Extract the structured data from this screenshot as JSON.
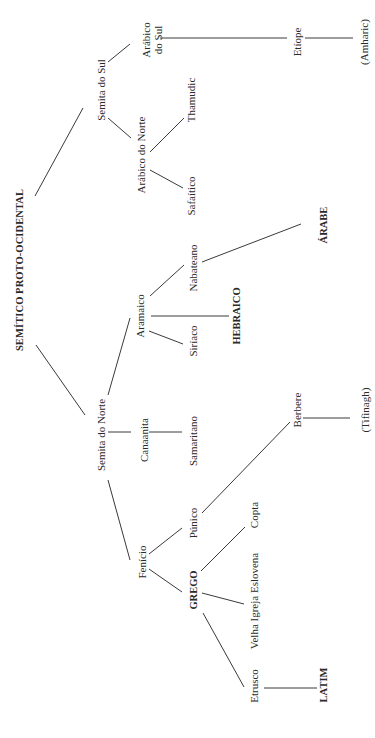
{
  "diagram": {
    "title": "SEMÍTICO PROTO-OCIDENTAL",
    "orientation": "rotated -90deg, root on left edge, tree grows to the right",
    "nodes": {
      "root": {
        "label": "SEMÍTICO PROTO-OCIDENTAL",
        "x": 20,
        "y": 270
      },
      "semita_sul": {
        "label": "Semita do Sul",
        "x": 101,
        "y": 90
      },
      "semita_norte": {
        "label": "Semita do Norte",
        "x": 101,
        "y": 435
      },
      "arabico_sul": {
        "label_line1": "Arábico",
        "label_line2": "do Sul",
        "x": 152,
        "y": 40
      },
      "arabico_norte": {
        "label": "Arábico do Norte",
        "x": 141,
        "y": 155
      },
      "thamudic": {
        "label": "Thamudic",
        "x": 191,
        "y": 100
      },
      "safaitico": {
        "label": "Safaítico",
        "x": 191,
        "y": 196
      },
      "etiope": {
        "label": "Etíope",
        "x": 297,
        "y": 42
      },
      "amharic": {
        "label": "(Amharic)",
        "x": 364,
        "y": 42
      },
      "aramaico": {
        "label": "Aramaico",
        "x": 140,
        "y": 316
      },
      "nabateano": {
        "label": "Nabateano",
        "x": 193,
        "y": 268
      },
      "siriaco": {
        "label": "Siríaco",
        "x": 193,
        "y": 341
      },
      "hebraico": {
        "label": "HEBRAICO",
        "x": 237,
        "y": 316
      },
      "arabe": {
        "label": "ÁRABE",
        "x": 324,
        "y": 225
      },
      "canaanita": {
        "label": "Canaanita",
        "x": 144,
        "y": 440
      },
      "samaritano": {
        "label": "Samaritano",
        "x": 193,
        "y": 441
      },
      "fenicio": {
        "label": "Fenício",
        "x": 142,
        "y": 562
      },
      "punico": {
        "label": "Púnico",
        "x": 193,
        "y": 523
      },
      "grego": {
        "label": "GREGO",
        "x": 194,
        "y": 590
      },
      "copta": {
        "label": "Copta",
        "x": 254,
        "y": 515
      },
      "velha_igreja": {
        "label": "Velha Igreja Eslovena",
        "x": 254,
        "y": 601
      },
      "etrusco": {
        "label": "Etrusco",
        "x": 254,
        "y": 686
      },
      "latim": {
        "label": "LATIM",
        "x": 324,
        "y": 685
      },
      "berbere": {
        "label": "Berbere",
        "x": 297,
        "y": 410
      },
      "tifinagh": {
        "label": "(Tifinagh)",
        "x": 365,
        "y": 410
      }
    },
    "edges": [
      {
        "from": "root",
        "to": "semita_sul",
        "x1": 35,
        "y1": 196,
        "x2": 83,
        "y2": 108
      },
      {
        "from": "root",
        "to": "semita_norte",
        "x1": 36,
        "y1": 345,
        "x2": 85,
        "y2": 415
      },
      {
        "from": "semita_sul",
        "to": "arabico_sul",
        "x1": 108,
        "y1": 62,
        "x2": 130,
        "y2": 44
      },
      {
        "from": "semita_sul",
        "to": "arabico_norte",
        "x1": 108,
        "y1": 118,
        "x2": 131,
        "y2": 138
      },
      {
        "from": "arabico_sul",
        "to": "etiope",
        "x1": 160,
        "y1": 38,
        "x2": 287,
        "y2": 38
      },
      {
        "from": "etiope",
        "to": "amharic",
        "x1": 305,
        "y1": 38,
        "x2": 353,
        "y2": 38
      },
      {
        "from": "arabico_norte",
        "to": "thamudic",
        "x1": 150,
        "y1": 152,
        "x2": 184,
        "y2": 118
      },
      {
        "from": "arabico_norte",
        "to": "safaitico",
        "x1": 150,
        "y1": 170,
        "x2": 183,
        "y2": 188
      },
      {
        "from": "semita_norte",
        "to": "aramaico",
        "x1": 108,
        "y1": 395,
        "x2": 130,
        "y2": 318
      },
      {
        "from": "semita_norte",
        "to": "canaanita",
        "x1": 108,
        "y1": 432,
        "x2": 131,
        "y2": 432
      },
      {
        "from": "semita_norte",
        "to": "fenicio",
        "x1": 108,
        "y1": 480,
        "x2": 130,
        "y2": 560
      },
      {
        "from": "aramaico",
        "to": "nabateano",
        "x1": 150,
        "y1": 296,
        "x2": 184,
        "y2": 265
      },
      {
        "from": "aramaico",
        "to": "hebraico",
        "x1": 151,
        "y1": 316,
        "x2": 229,
        "y2": 316
      },
      {
        "from": "aramaico",
        "to": "siriaco",
        "x1": 149,
        "y1": 331,
        "x2": 183,
        "y2": 344
      },
      {
        "from": "nabateano",
        "to": "arabe",
        "x1": 202,
        "y1": 262,
        "x2": 301,
        "y2": 224
      },
      {
        "from": "canaanita",
        "to": "samaritano",
        "x1": 149,
        "y1": 432,
        "x2": 182,
        "y2": 432
      },
      {
        "from": "fenicio",
        "to": "punico",
        "x1": 149,
        "y1": 554,
        "x2": 182,
        "y2": 528
      },
      {
        "from": "fenicio",
        "to": "grego",
        "x1": 149,
        "y1": 569,
        "x2": 182,
        "y2": 592
      },
      {
        "from": "punico",
        "to": "berbere",
        "x1": 202,
        "y1": 513,
        "x2": 290,
        "y2": 422
      },
      {
        "from": "berbere",
        "to": "tifinagh",
        "x1": 303,
        "y1": 418,
        "x2": 350,
        "y2": 418
      },
      {
        "from": "grego",
        "to": "copta",
        "x1": 201,
        "y1": 571,
        "x2": 245,
        "y2": 527
      },
      {
        "from": "grego",
        "to": "velha_igreja",
        "x1": 202,
        "y1": 593,
        "x2": 244,
        "y2": 604
      },
      {
        "from": "grego",
        "to": "etrusco",
        "x1": 203,
        "y1": 613,
        "x2": 244,
        "y2": 687
      },
      {
        "from": "etrusco",
        "to": "latim",
        "x1": 264,
        "y1": 688,
        "x2": 317,
        "y2": 688
      }
    ]
  }
}
